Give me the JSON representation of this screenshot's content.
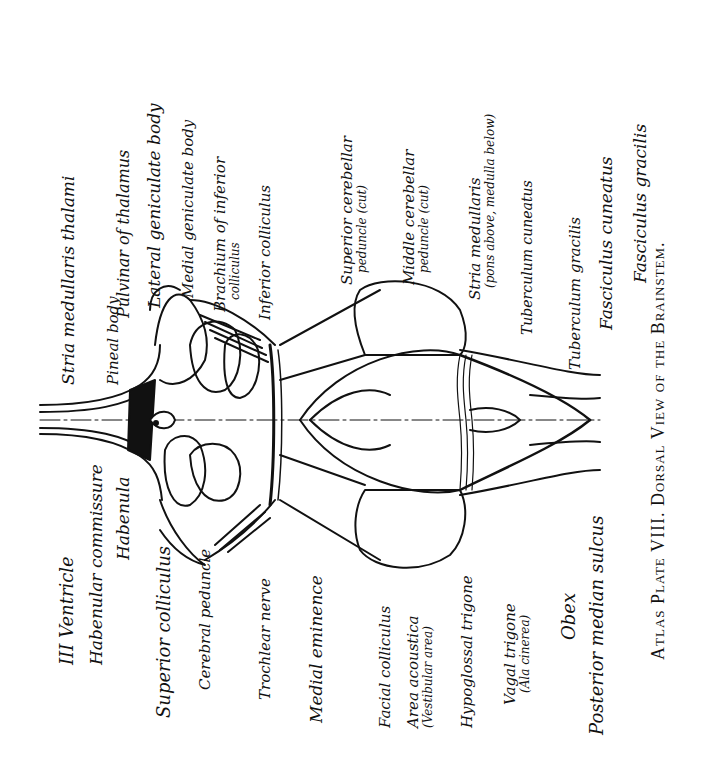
{
  "caption": "Atlas Plate VIII. Dorsal View of the Brainstem.",
  "labels": {
    "stria_medullaris_thalami": "Stria medullaris thalami",
    "pineal_body": "Pineal body",
    "pulvinar": "Pulvinar of thalamus",
    "lateral_geniculate": "Lateral geniculate body",
    "medial_geniculate": "Medial geniculate body",
    "brachium_inferior_1": "Brachium of inferior",
    "brachium_inferior_2": "colliculus",
    "inferior_colliculus": "Inferior colliculus",
    "superior_cerebellar_1": "Superior cerebellar",
    "superior_cerebellar_2": "peduncle (cut)",
    "middle_cerebellar_1": "Middle cerebellar",
    "middle_cerebellar_2": "peduncle (cut)",
    "stria_medullaris_1": "Stria medullaris",
    "stria_medullaris_2": "(pons above, medulla below)",
    "tuberculum_cuneatus": "Tuberculum cuneatus",
    "tuberculum_gracilis": "Tuberculum gracilis",
    "fasciculus_cuneatus": "Fasciculus cuneatus",
    "fasciculus_gracilis": "Fasciculus gracilis",
    "third_ventricle": "III  Ventricle",
    "habenular_commissure": "Habenular commissure",
    "habenula": "Habenula",
    "superior_colliculus": "Superior colliculus",
    "cerebral_peduncle": "Cerebral peduncle",
    "trochlear_nerve": "Trochlear nerve",
    "medial_eminence": "Medial eminence",
    "facial_colliculus": "Facial colliculus",
    "area_acoustica_1": "Area acoustica",
    "area_acoustica_2": "(Vestibular area)",
    "hypoglossal_trigone": "Hypoglossal trigone",
    "vagal_trigone_1": "Vagal trigone",
    "vagal_trigone_2": "(Ala cinerea)",
    "obex": "Obex",
    "posterior_median_sulcus": "Posterior median sulcus"
  },
  "colors": {
    "ink": "#111111",
    "paper": "#ffffff"
  }
}
